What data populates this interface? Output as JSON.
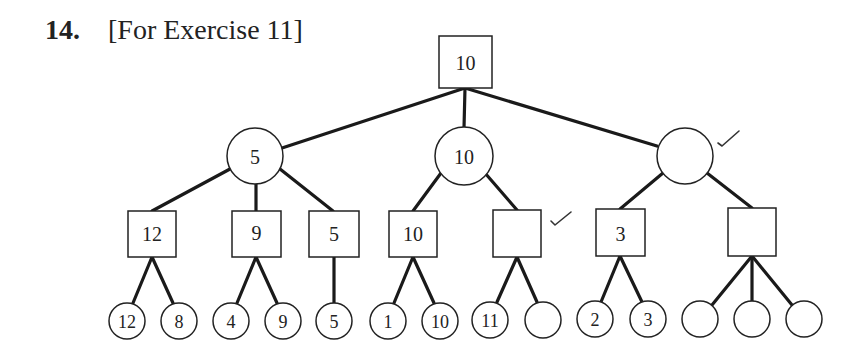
{
  "exercise": {
    "number": "14.",
    "caption": "[For Exercise 11]"
  },
  "tree": {
    "description": "Game tree: square nodes = MAX, circle nodes = MIN; check marks indicate pruned/marked nodes",
    "root": {
      "shape": "square",
      "value": "10"
    },
    "level1": [
      {
        "shape": "circle",
        "value": "5",
        "checked": false
      },
      {
        "shape": "circle",
        "value": "10",
        "checked": false
      },
      {
        "shape": "circle",
        "value": "",
        "checked": true
      }
    ],
    "level2": [
      {
        "shape": "square",
        "value": "12",
        "parent": 0,
        "checked": false
      },
      {
        "shape": "square",
        "value": "9",
        "parent": 0,
        "checked": false
      },
      {
        "shape": "square",
        "value": "5",
        "parent": 0,
        "checked": false
      },
      {
        "shape": "square",
        "value": "10",
        "parent": 1,
        "checked": false
      },
      {
        "shape": "square",
        "value": "",
        "parent": 1,
        "checked": true
      },
      {
        "shape": "square",
        "value": "3",
        "parent": 2,
        "checked": false
      },
      {
        "shape": "square",
        "value": "",
        "parent": 2,
        "checked": false
      }
    ],
    "leaves": [
      {
        "shape": "circle",
        "value": "12",
        "parent": 0
      },
      {
        "shape": "circle",
        "value": "8",
        "parent": 0
      },
      {
        "shape": "circle",
        "value": "4",
        "parent": 1
      },
      {
        "shape": "circle",
        "value": "9",
        "parent": 1
      },
      {
        "shape": "circle",
        "value": "5",
        "parent": 2
      },
      {
        "shape": "circle",
        "value": "1",
        "parent": 3
      },
      {
        "shape": "circle",
        "value": "10",
        "parent": 3
      },
      {
        "shape": "circle",
        "value": "11",
        "parent": 4
      },
      {
        "shape": "circle",
        "value": "",
        "parent": 4
      },
      {
        "shape": "circle",
        "value": "2",
        "parent": 5
      },
      {
        "shape": "circle",
        "value": "3",
        "parent": 5
      },
      {
        "shape": "circle",
        "value": "",
        "parent": 6
      },
      {
        "shape": "circle",
        "value": "",
        "parent": 6
      },
      {
        "shape": "circle",
        "value": "",
        "parent": 6
      }
    ],
    "check_mark_glyph": "✓"
  }
}
